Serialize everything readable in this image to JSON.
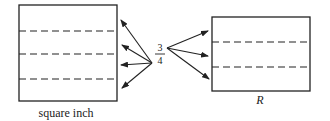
{
  "diagram": {
    "left_box": {
      "label": "square inch",
      "dashed_lines": 3
    },
    "right_box": {
      "label": "R",
      "dashed_lines": 2
    },
    "mapping_label": {
      "numerator": "3",
      "denominator": "4"
    },
    "stroke_color": "#222222"
  }
}
